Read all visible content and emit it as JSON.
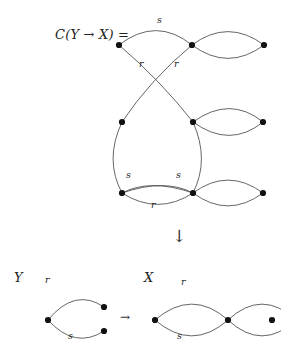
{
  "figure": {
    "formula": "C(Y → X) =",
    "vertical_arrow": "↓",
    "horizontal_arrow": "→",
    "labels": {
      "top_s": "s",
      "top_r_left": "r",
      "top_r_right": "r",
      "bottom_s_left": "s",
      "bottom_s_right": "s",
      "bottom_r": "r",
      "source_name": "Y",
      "source_r": "r",
      "source_s": "s",
      "target_name": "X",
      "target_r": "r",
      "target_s": "s"
    },
    "colors": {
      "stroke": "#555555",
      "vertex": "#111111",
      "text": "#222222",
      "background": "#ffffff"
    }
  }
}
